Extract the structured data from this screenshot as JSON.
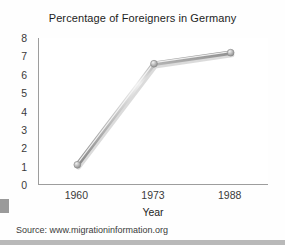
{
  "chart_data": {
    "type": "line",
    "title": "Percentage of Foreigners in Germany",
    "xlabel": "Year",
    "ylabel": "",
    "categories": [
      "1960",
      "1973",
      "1988"
    ],
    "values": [
      1.1,
      6.6,
      7.2
    ],
    "series": [
      {
        "name": "Percentage of Foreigners",
        "values": [
          1.1,
          6.6,
          7.2
        ]
      }
    ],
    "ylim": [
      0,
      8
    ],
    "yticks": [
      0,
      1,
      2,
      3,
      4,
      5,
      6,
      7,
      8
    ],
    "ytick_labels": [
      "0",
      "1",
      "2",
      "3",
      "4",
      "5",
      "6",
      "7",
      "8"
    ],
    "xtick_labels": [
      "1960",
      "1973",
      "1988"
    ],
    "grid": false,
    "legend": "none",
    "marker": "circle",
    "line_style": "3d-bevel-grey",
    "colors": {
      "line_light": "#e8e8e8",
      "line_mid": "#b0b0b0",
      "line_dark": "#8a8a8a",
      "marker": "#a8a8a8",
      "axis": "#9d9d9d",
      "text": "#1d1d1d",
      "tick_text": "#3a3a3a",
      "plot_background": "#ffffff",
      "page_background": "#fefefe",
      "bottom_band": "#b9b9b9"
    }
  },
  "source": {
    "text": "Source: www.migrationinformation.org"
  }
}
